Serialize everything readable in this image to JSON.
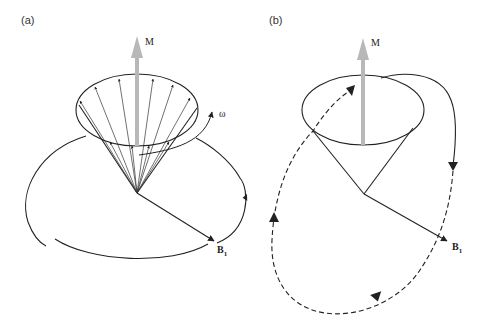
{
  "panels": [
    {
      "id": "a",
      "label": "(a)",
      "magnetization_label": "M",
      "angular_frequency_label": "ω",
      "field_label": "B",
      "field_subscript": "1",
      "description": "Precessing magnetization vectors on a cone about M; B1 field rotating in the transverse plane at frequency ω"
    },
    {
      "id": "b",
      "label": "(b)",
      "magnetization_label": "M",
      "field_label": "B",
      "field_subscript": "1",
      "description": "Cone about M with nutation trajectory (solid then dashed) induced by B1"
    }
  ],
  "colors": {
    "line": "#222222",
    "magnetization_arrow": "#b8b8b8",
    "background": "#ffffff"
  }
}
